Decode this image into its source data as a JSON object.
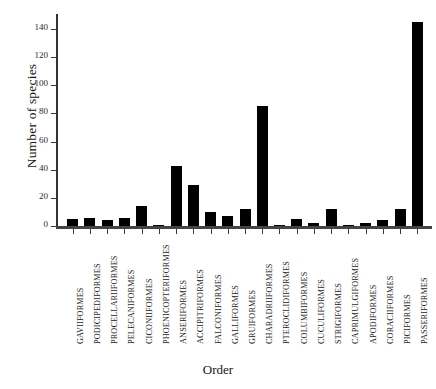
{
  "chart_data": {
    "type": "bar",
    "title": "",
    "xlabel": "Order",
    "ylabel": "Number of species",
    "ylim": [
      0,
      150
    ],
    "ytick_values": [
      0,
      20,
      40,
      60,
      80,
      100,
      120,
      140
    ],
    "ytick_labels": [
      "0",
      "20",
      "40",
      "60",
      "80",
      "100",
      "120",
      "140"
    ],
    "grid": false,
    "legend": null,
    "bar_color": "#000000",
    "categories": [
      "GAVIIFORMES",
      "PODICIPEDIFORMES",
      "PROCELLARIIFORMES",
      "PELECANIFORMES",
      "CICONIIFORMES",
      "PHOENICOPTERIFORMES",
      "ANSERIFORMES",
      "ACCIPITRIFORMES",
      "FALCONIFORMES",
      "GALLIFORMES",
      "GRUIFORMES",
      "CHARADRIIFORMES",
      "PTEROCLIDIFORMES",
      "COLUMBIFORMES",
      "CUCULIFORMES",
      "STRIGIFORMES",
      "CAPRIMULGIFORMES",
      "APODIFORMES",
      "CORACIIFORMES",
      "PICIFORMES",
      "PASSERIFORMES"
    ],
    "values": [
      5,
      6,
      4,
      6,
      14,
      1,
      43,
      29,
      10,
      7,
      12,
      85,
      0,
      5,
      2,
      12,
      1,
      2,
      4,
      12,
      145
    ]
  }
}
